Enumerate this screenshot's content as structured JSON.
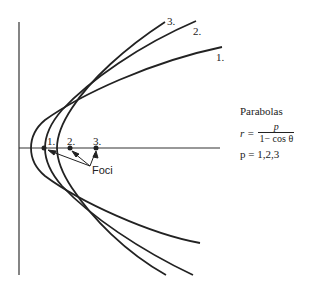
{
  "diagram": {
    "title": "Parabolas",
    "equation": {
      "lhs": "r =",
      "numerator": "p",
      "denominator": "1− cos θ"
    },
    "parameters": "p = 1,2,3",
    "curve_labels": [
      "1.",
      "2.",
      "3."
    ],
    "focus_labels": [
      "1.",
      "2.",
      "3."
    ],
    "foci_label": "Foci",
    "line_color": "#222222"
  }
}
